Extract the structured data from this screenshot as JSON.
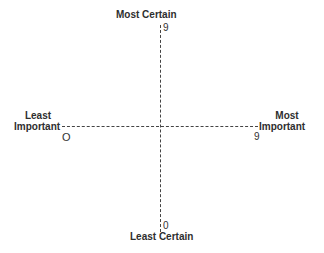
{
  "diagram": {
    "type": "quadrant-matrix",
    "vertical_axis": {
      "top_label": "Most Certain",
      "top_value": "9",
      "bottom_label": "Least Certain",
      "bottom_value": "0"
    },
    "horizontal_axis": {
      "left_label_line1": "Least",
      "left_label_line2": "Important",
      "left_value": "O",
      "right_label_line1": "Most",
      "right_label_line2": "Important",
      "right_value": "9"
    },
    "line_style": "dashed",
    "line_color": "#444444"
  }
}
